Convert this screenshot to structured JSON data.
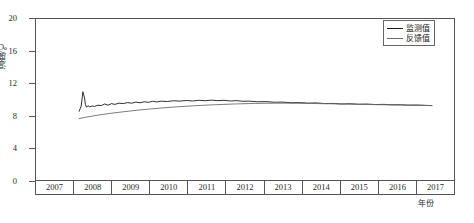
{
  "chart_data": {
    "type": "line",
    "title": "",
    "xlabel": "年份",
    "ylabel": "温度/℃",
    "xlim": [
      2007,
      2017
    ],
    "ylim": [
      0,
      20
    ],
    "ytick_labels": [
      "20",
      "16",
      "12",
      "8",
      "4",
      "0"
    ],
    "yticks": [
      20,
      16,
      12,
      8,
      4,
      0
    ],
    "gridlines": [
      16,
      12,
      8,
      4
    ],
    "grid": true,
    "grid_style": "dashed",
    "grid_color": "#9fb7cf",
    "legend_position": "top-right",
    "xtick_labels": [
      "2007",
      "2008",
      "2009",
      "2010",
      "2011",
      "2012",
      "2013",
      "2014",
      "2015",
      "2016",
      "2017"
    ],
    "series": [
      {
        "name": "监测值",
        "color": "#1a1a1a",
        "x": [
          2008.05,
          2008.1,
          2008.14,
          2008.18,
          2008.2,
          2008.23,
          2008.26,
          2008.3,
          2008.36,
          2008.42,
          2008.5,
          2008.58,
          2008.66,
          2008.74,
          2008.82,
          2008.9,
          2009.0,
          2009.1,
          2009.2,
          2009.3,
          2009.4,
          2009.5,
          2009.6,
          2009.7,
          2009.8,
          2009.9,
          2010.0,
          2010.15,
          2010.3,
          2010.45,
          2010.6,
          2010.75,
          2010.9,
          2011.05,
          2011.2,
          2011.35,
          2011.5,
          2011.65,
          2011.8,
          2011.95,
          2012.1,
          2012.3,
          2012.5,
          2012.7,
          2012.9,
          2013.1,
          2013.3,
          2013.5,
          2013.7,
          2013.9,
          2014.1,
          2014.3,
          2014.5,
          2014.7,
          2014.9,
          2015.1,
          2015.3,
          2015.5,
          2015.7,
          2015.9,
          2016.1,
          2016.3,
          2016.45
        ],
        "y": [
          8.55,
          9.2,
          10.95,
          10.2,
          9.35,
          9.05,
          9.25,
          9.1,
          9.2,
          9.15,
          9.3,
          9.25,
          9.45,
          9.3,
          9.5,
          9.4,
          9.55,
          9.5,
          9.62,
          9.55,
          9.68,
          9.6,
          9.72,
          9.65,
          9.78,
          9.7,
          9.8,
          9.75,
          9.85,
          9.8,
          9.88,
          9.82,
          9.9,
          9.85,
          9.92,
          9.86,
          9.9,
          9.82,
          9.86,
          9.78,
          9.8,
          9.72,
          9.74,
          9.66,
          9.68,
          9.6,
          9.62,
          9.55,
          9.58,
          9.5,
          9.52,
          9.45,
          9.48,
          9.42,
          9.44,
          9.38,
          9.4,
          9.35,
          9.36,
          9.3,
          9.32,
          9.28,
          9.25
        ]
      },
      {
        "name": "反馈值",
        "color": "#6d6d6d",
        "x": [
          2008.05,
          2008.2,
          2008.4,
          2008.6,
          2008.8,
          2009.0,
          2009.25,
          2009.5,
          2009.75,
          2010.0,
          2010.25,
          2010.5,
          2010.75,
          2011.0,
          2011.25,
          2011.5,
          2011.75,
          2012.0,
          2012.25,
          2012.5,
          2012.75,
          2013.0,
          2013.25,
          2013.5,
          2013.75,
          2014.0,
          2014.25,
          2014.5,
          2014.75,
          2015.0,
          2015.25,
          2015.5,
          2015.75,
          2016.0,
          2016.25,
          2016.45
        ],
        "y": [
          7.65,
          7.82,
          8.0,
          8.16,
          8.3,
          8.43,
          8.58,
          8.72,
          8.84,
          8.95,
          9.05,
          9.14,
          9.22,
          9.29,
          9.35,
          9.4,
          9.45,
          9.49,
          9.52,
          9.54,
          9.55,
          9.55,
          9.54,
          9.52,
          9.5,
          9.48,
          9.45,
          9.43,
          9.4,
          9.38,
          9.36,
          9.34,
          9.32,
          9.3,
          9.27,
          9.25
        ]
      }
    ]
  },
  "legend": {
    "items": [
      {
        "label": "监测值"
      },
      {
        "label": "反馈值"
      }
    ]
  }
}
